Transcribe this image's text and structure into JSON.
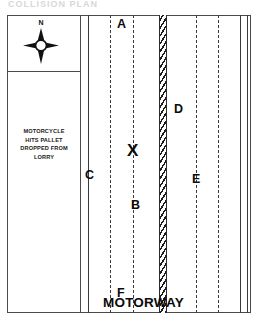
{
  "scan": {
    "header_text": "COLLISION PLAN"
  },
  "diagram": {
    "title": "MOTORWAY",
    "compass": {
      "icon": "compass-rose-icon",
      "north_label": "N"
    },
    "caption": {
      "lines": [
        "MOTORCYCLE",
        "HITS PALLET",
        "DROPPED FROM",
        "LORRY"
      ]
    },
    "road_name_label": "MOTORWAY",
    "impact_marker": {
      "glyph": "X",
      "name": "impact-point-marker"
    },
    "labels": [
      {
        "id": "A",
        "text": "A",
        "x": 36,
        "y": 3
      },
      {
        "id": "C",
        "text": "C",
        "x": 4,
        "y": 154
      },
      {
        "id": "B",
        "text": "B",
        "x": 50,
        "y": 184
      },
      {
        "id": "D",
        "text": "D",
        "x": 93,
        "y": 88
      },
      {
        "id": "E",
        "text": "E",
        "x": 111,
        "y": 158
      },
      {
        "id": "F",
        "text": "F",
        "x": 36,
        "y": 272
      }
    ],
    "colors": {
      "ink": "#3a3a3a",
      "text": "#0b0b0b",
      "barrier": "#1d1d1d",
      "background": "#ffffff"
    },
    "lines": {
      "left_carriageway_edge": "solid",
      "left_lane_dividers": "dashed",
      "central_barrier": "hatched",
      "right_lane_dividers": "dashed",
      "right_carriageway_edge": "solid",
      "hard_shoulder_edge": "solid"
    }
  }
}
